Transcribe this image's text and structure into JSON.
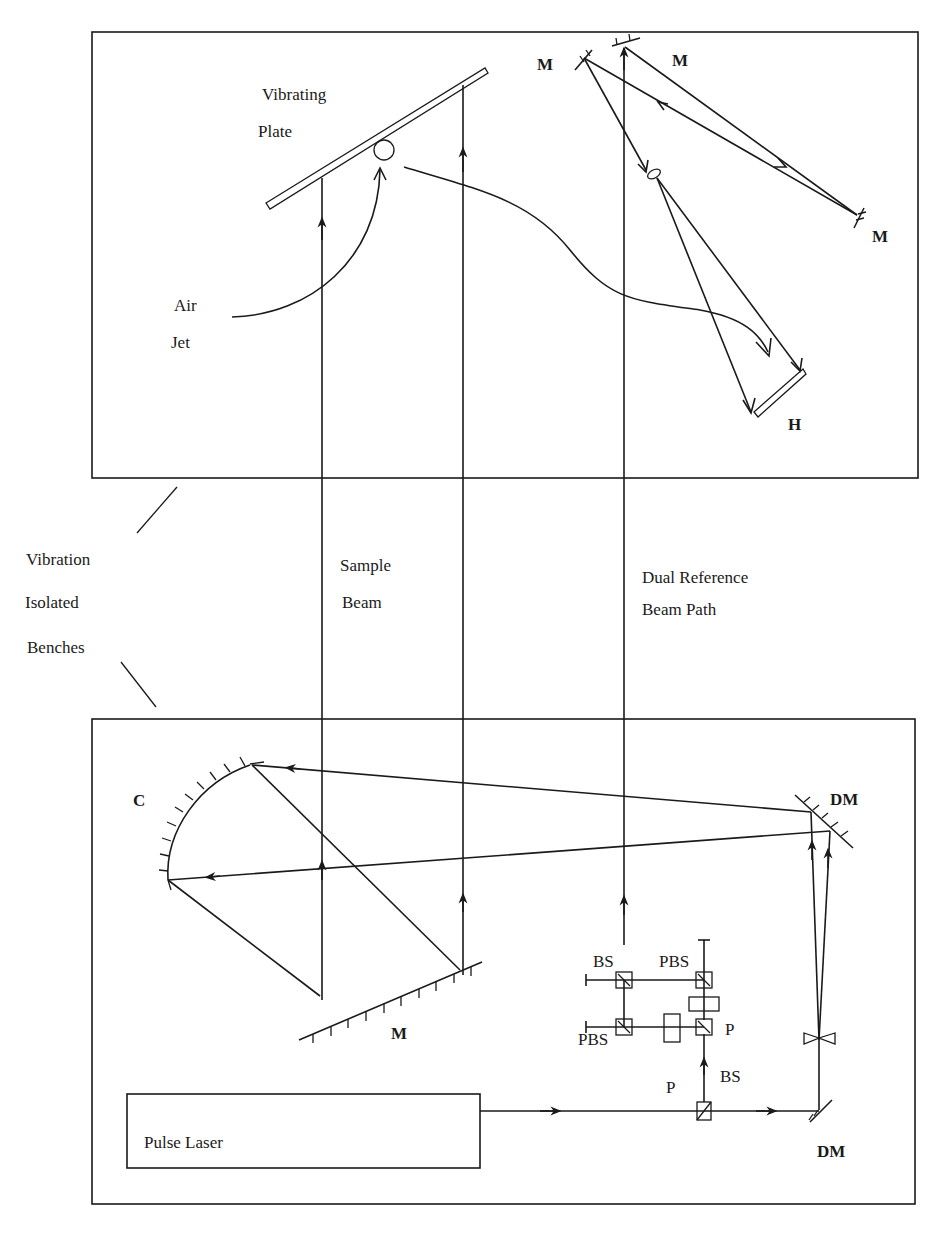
{
  "diagram": {
    "title": "",
    "colors": {
      "ink": "#1a1a1a",
      "background": "#ffffff"
    },
    "top_bench": {
      "labels": {
        "vibrating_plate_line1": "Vibrating",
        "vibrating_plate_line2": "Plate",
        "air_jet_line1": "Air",
        "air_jet_line2": "Jet",
        "mirror_1": "M",
        "mirror_2": "M",
        "mirror_3": "M",
        "hologram": "H"
      }
    },
    "between_benches": {
      "labels": {
        "bench_line1": "Vibration",
        "bench_line2": "Isolated",
        "bench_line3": "Benches",
        "sample_beam_line1": "Sample",
        "sample_beam_line2": "Beam",
        "reference_line1": "Dual Reference",
        "reference_line2": "Beam Path"
      }
    },
    "bottom_bench": {
      "labels": {
        "concave_mirror": "C",
        "mirror_m": "M",
        "dichroic_top": "DM",
        "dichroic_bottom": "DM",
        "bs_top": "BS",
        "pbs_top": "PBS",
        "pbs_bottom": "PBS",
        "bs_bottom": "BS",
        "polarizer_right": "P",
        "polarizer_bottom": "P",
        "laser": "Pulse Laser"
      }
    },
    "nodes": [
      {
        "id": "vibrating-plate",
        "type": "object"
      },
      {
        "id": "air-jet",
        "type": "source"
      },
      {
        "id": "mirror-m1",
        "type": "mirror"
      },
      {
        "id": "mirror-m2",
        "type": "mirror"
      },
      {
        "id": "mirror-m3",
        "type": "mirror"
      },
      {
        "id": "lens",
        "type": "lens"
      },
      {
        "id": "hologram-h",
        "type": "recording-plate"
      },
      {
        "id": "concave-mirror-c",
        "type": "mirror"
      },
      {
        "id": "mirror-m",
        "type": "mirror"
      },
      {
        "id": "dichroic-mirror-top",
        "type": "mirror"
      },
      {
        "id": "dichroic-mirror-bottom",
        "type": "mirror"
      },
      {
        "id": "beam-splitter-top",
        "type": "beam-splitter"
      },
      {
        "id": "polarizing-beam-splitter-top",
        "type": "beam-splitter"
      },
      {
        "id": "polarizing-beam-splitter-bottom",
        "type": "beam-splitter"
      },
      {
        "id": "beam-splitter-bottom",
        "type": "beam-splitter"
      },
      {
        "id": "polarizer-right",
        "type": "polarizer"
      },
      {
        "id": "polarizer-bottom",
        "type": "polarizer"
      },
      {
        "id": "diverging-lens",
        "type": "lens"
      },
      {
        "id": "pulse-laser",
        "type": "laser"
      }
    ]
  }
}
